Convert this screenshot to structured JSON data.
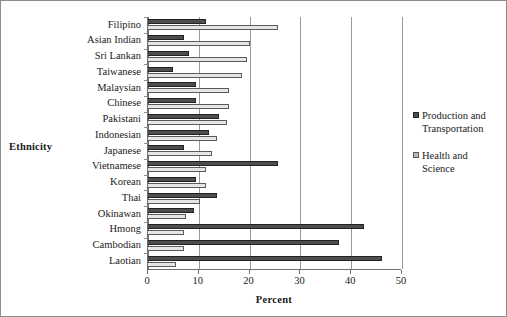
{
  "chart_data": {
    "type": "bar",
    "orientation": "horizontal",
    "title": "",
    "xlabel": "Percent",
    "ylabel": "Ethnicity",
    "xlim": [
      0,
      50
    ],
    "xticks": [
      0,
      10,
      20,
      30,
      40,
      50
    ],
    "grid": true,
    "legend_position": "right",
    "categories": [
      "Filipino",
      "Asian Indian",
      "Sri Lankan",
      "Taiwanese",
      "Malaysian",
      "Chinese",
      "Pakistani",
      "Indonesian",
      "Japanese",
      "Vietnamese",
      "Korean",
      "Thai",
      "Okinawan",
      "Hmong",
      "Cambodian",
      "Laotian"
    ],
    "series": [
      {
        "name": "Production and Transportation",
        "color": "#4d4d4d",
        "values": [
          11.5,
          7.0,
          8.0,
          5.0,
          9.5,
          9.5,
          14.0,
          12.0,
          7.0,
          25.5,
          9.5,
          13.5,
          9.0,
          42.5,
          37.5,
          46.0
        ]
      },
      {
        "name": "Health and Science",
        "color": "#e6e6e6",
        "values": [
          25.5,
          20.0,
          19.5,
          18.5,
          16.0,
          16.0,
          15.5,
          13.5,
          12.5,
          11.5,
          11.5,
          10.3,
          7.5,
          7.0,
          7.0,
          5.5
        ]
      }
    ]
  },
  "legend": {
    "entries": [
      {
        "label": "Production and\nTransportation",
        "series": "Production and Transportation"
      },
      {
        "label": "Health and\nScience",
        "series": "Health and Science"
      }
    ]
  },
  "axes": {
    "x_title": "Percent",
    "y_title": "Ethnicity"
  }
}
